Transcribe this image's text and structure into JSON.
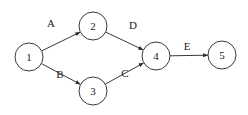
{
  "diagram": {
    "type": "directed-network",
    "colors": {
      "stroke": "#3a3a3a",
      "text": "#222222",
      "background": "#ffffff"
    },
    "nodes": [
      {
        "id": "1",
        "label": "1",
        "cx": 29,
        "cy": 57,
        "r": 14
      },
      {
        "id": "2",
        "label": "2",
        "cx": 93,
        "cy": 26,
        "r": 14
      },
      {
        "id": "3",
        "label": "3",
        "cx": 93,
        "cy": 91,
        "r": 14
      },
      {
        "id": "4",
        "label": "4",
        "cx": 156,
        "cy": 56,
        "r": 14
      },
      {
        "id": "5",
        "label": "5",
        "cx": 222,
        "cy": 55,
        "r": 14
      }
    ],
    "edges": [
      {
        "id": "A",
        "label": "A",
        "from": "1",
        "to": "2",
        "lx": 51,
        "ly": 27
      },
      {
        "id": "B",
        "label": "B",
        "from": "1",
        "to": "3",
        "lx": 60,
        "ly": 78
      },
      {
        "id": "C",
        "label": "C",
        "from": "3",
        "to": "4",
        "lx": 125,
        "ly": 77
      },
      {
        "id": "D",
        "label": "D",
        "from": "2",
        "to": "4",
        "lx": 133,
        "ly": 29
      },
      {
        "id": "E",
        "label": "E",
        "from": "4",
        "to": "5",
        "lx": 187,
        "ly": 50
      }
    ]
  }
}
